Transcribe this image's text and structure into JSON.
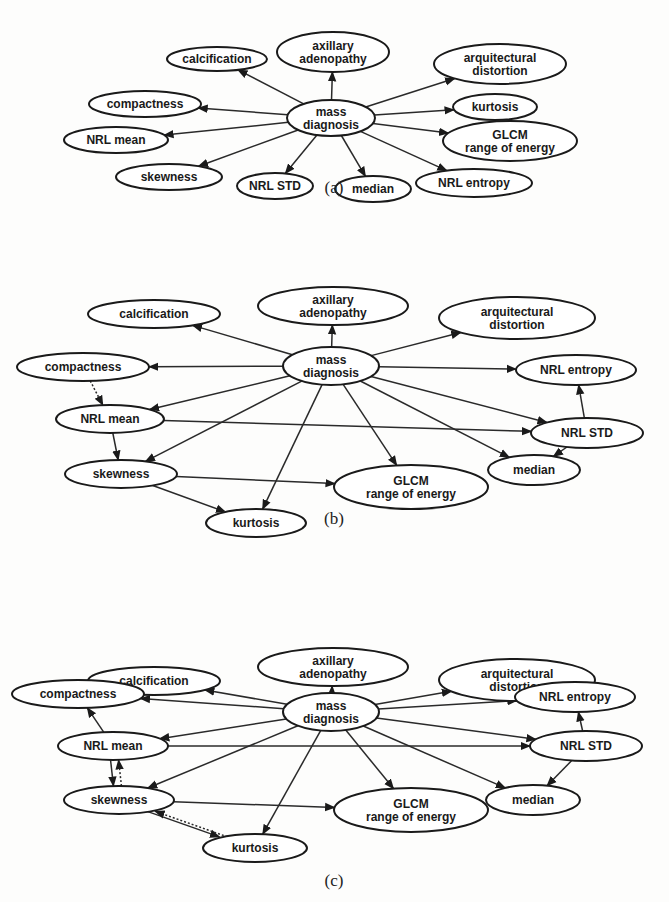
{
  "figure": {
    "panels": [
      {
        "id": "a",
        "caption": "(a)",
        "nodes": [
          {
            "id": "mass",
            "lines": [
              "mass",
              "diagnosis"
            ]
          },
          {
            "id": "calcification",
            "lines": [
              "calcification"
            ]
          },
          {
            "id": "axillary",
            "lines": [
              "axillary",
              "adenopathy"
            ]
          },
          {
            "id": "arquitectural",
            "lines": [
              "arquitectural",
              "distortion"
            ]
          },
          {
            "id": "compactness",
            "lines": [
              "compactness"
            ]
          },
          {
            "id": "kurtosis",
            "lines": [
              "kurtosis"
            ]
          },
          {
            "id": "nrlmean",
            "lines": [
              "NRL mean"
            ]
          },
          {
            "id": "glcm",
            "lines": [
              "GLCM",
              "range of energy"
            ]
          },
          {
            "id": "skewness",
            "lines": [
              "skewness"
            ]
          },
          {
            "id": "nrlstd",
            "lines": [
              "NRL STD"
            ]
          },
          {
            "id": "median",
            "lines": [
              "median"
            ]
          },
          {
            "id": "nrlentropy",
            "lines": [
              "NRL entropy"
            ]
          }
        ],
        "edges": [
          {
            "from": "mass",
            "to": "calcification",
            "style": "solid"
          },
          {
            "from": "mass",
            "to": "axillary",
            "style": "solid"
          },
          {
            "from": "mass",
            "to": "arquitectural",
            "style": "solid"
          },
          {
            "from": "mass",
            "to": "compactness",
            "style": "solid"
          },
          {
            "from": "mass",
            "to": "kurtosis",
            "style": "solid"
          },
          {
            "from": "mass",
            "to": "nrlmean",
            "style": "solid"
          },
          {
            "from": "mass",
            "to": "glcm",
            "style": "solid"
          },
          {
            "from": "mass",
            "to": "skewness",
            "style": "solid"
          },
          {
            "from": "mass",
            "to": "nrlstd",
            "style": "solid"
          },
          {
            "from": "mass",
            "to": "median",
            "style": "solid"
          },
          {
            "from": "mass",
            "to": "nrlentropy",
            "style": "solid"
          }
        ]
      },
      {
        "id": "b",
        "caption": "(b)",
        "nodes": [
          {
            "id": "mass",
            "lines": [
              "mass",
              "diagnosis"
            ]
          },
          {
            "id": "calcification",
            "lines": [
              "calcification"
            ]
          },
          {
            "id": "axillary",
            "lines": [
              "axillary",
              "adenopathy"
            ]
          },
          {
            "id": "arquitectural",
            "lines": [
              "arquitectural",
              "distortion"
            ]
          },
          {
            "id": "compactness",
            "lines": [
              "compactness"
            ]
          },
          {
            "id": "nrlentropy",
            "lines": [
              "NRL entropy"
            ]
          },
          {
            "id": "nrlmean",
            "lines": [
              "NRL mean"
            ]
          },
          {
            "id": "nrlstd",
            "lines": [
              "NRL STD"
            ]
          },
          {
            "id": "skewness",
            "lines": [
              "skewness"
            ]
          },
          {
            "id": "glcm",
            "lines": [
              "GLCM",
              "range of energy"
            ]
          },
          {
            "id": "median",
            "lines": [
              "median"
            ]
          },
          {
            "id": "kurtosis",
            "lines": [
              "kurtosis"
            ]
          }
        ],
        "edges": [
          {
            "from": "mass",
            "to": "calcification",
            "style": "solid"
          },
          {
            "from": "mass",
            "to": "axillary",
            "style": "solid"
          },
          {
            "from": "mass",
            "to": "arquitectural",
            "style": "solid"
          },
          {
            "from": "mass",
            "to": "compactness",
            "style": "solid"
          },
          {
            "from": "mass",
            "to": "nrlentropy",
            "style": "solid"
          },
          {
            "from": "mass",
            "to": "nrlmean",
            "style": "solid"
          },
          {
            "from": "mass",
            "to": "skewness",
            "style": "solid"
          },
          {
            "from": "mass",
            "to": "kurtosis",
            "style": "solid"
          },
          {
            "from": "mass",
            "to": "glcm",
            "style": "solid"
          },
          {
            "from": "mass",
            "to": "median",
            "style": "solid"
          },
          {
            "from": "mass",
            "to": "nrlstd",
            "style": "solid"
          },
          {
            "from": "compactness",
            "to": "nrlmean",
            "style": "dotted"
          },
          {
            "from": "nrlmean",
            "to": "skewness",
            "style": "solid"
          },
          {
            "from": "nrlmean",
            "to": "nrlstd",
            "style": "solid"
          },
          {
            "from": "nrlstd",
            "to": "nrlentropy",
            "style": "solid"
          },
          {
            "from": "nrlstd",
            "to": "median",
            "style": "solid"
          },
          {
            "from": "skewness",
            "to": "glcm",
            "style": "solid"
          },
          {
            "from": "skewness",
            "to": "kurtosis",
            "style": "solid"
          }
        ]
      },
      {
        "id": "c",
        "caption": "(c)",
        "nodes": [
          {
            "id": "mass",
            "lines": [
              "mass",
              "diagnosis"
            ]
          },
          {
            "id": "calcification",
            "lines": [
              "calcification"
            ]
          },
          {
            "id": "axillary",
            "lines": [
              "axillary",
              "adenopathy"
            ]
          },
          {
            "id": "arquitectural",
            "lines": [
              "arquitectural",
              "distortion"
            ]
          },
          {
            "id": "compactness",
            "lines": [
              "compactness"
            ]
          },
          {
            "id": "nrlentropy",
            "lines": [
              "NRL entropy"
            ]
          },
          {
            "id": "nrlmean",
            "lines": [
              "NRL mean"
            ]
          },
          {
            "id": "nrlstd",
            "lines": [
              "NRL STD"
            ]
          },
          {
            "id": "skewness",
            "lines": [
              "skewness"
            ]
          },
          {
            "id": "median",
            "lines": [
              "median"
            ]
          },
          {
            "id": "glcm",
            "lines": [
              "GLCM",
              "range of energy"
            ]
          },
          {
            "id": "kurtosis",
            "lines": [
              "kurtosis"
            ]
          }
        ],
        "edges": [
          {
            "from": "mass",
            "to": "calcification",
            "style": "solid"
          },
          {
            "from": "mass",
            "to": "axillary",
            "style": "solid"
          },
          {
            "from": "mass",
            "to": "arquitectural",
            "style": "solid"
          },
          {
            "from": "mass",
            "to": "compactness",
            "style": "solid"
          },
          {
            "from": "mass",
            "to": "nrlentropy",
            "style": "solid"
          },
          {
            "from": "mass",
            "to": "nrlmean",
            "style": "solid"
          },
          {
            "from": "mass",
            "to": "skewness",
            "style": "solid"
          },
          {
            "from": "mass",
            "to": "kurtosis",
            "style": "solid"
          },
          {
            "from": "mass",
            "to": "glcm",
            "style": "solid"
          },
          {
            "from": "mass",
            "to": "median",
            "style": "solid"
          },
          {
            "from": "mass",
            "to": "nrlstd",
            "style": "solid"
          },
          {
            "from": "nrlmean",
            "to": "compactness",
            "style": "solid"
          },
          {
            "from": "nrlmean",
            "to": "nrlstd",
            "style": "solid"
          },
          {
            "from": "nrlmean",
            "to": "skewness",
            "style": "solid"
          },
          {
            "from": "skewness",
            "to": "nrlmean",
            "style": "dotted"
          },
          {
            "from": "nrlstd",
            "to": "nrlentropy",
            "style": "solid"
          },
          {
            "from": "nrlstd",
            "to": "median",
            "style": "solid"
          },
          {
            "from": "skewness",
            "to": "glcm",
            "style": "solid"
          },
          {
            "from": "skewness",
            "to": "kurtosis",
            "style": "solid"
          },
          {
            "from": "kurtosis",
            "to": "skewness",
            "style": "dotted"
          }
        ]
      }
    ]
  }
}
